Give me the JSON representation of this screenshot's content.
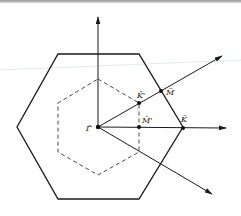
{
  "diagram": {
    "type": "hexagonal-brillouin-zone",
    "colors": {
      "stroke": "#1a1a1a",
      "dashed": "#333333",
      "faint_line": "#cfd8df"
    },
    "points": {
      "gamma": {
        "label": "Γ̄",
        "x": 98,
        "y": 127
      },
      "K": {
        "label": "K̄",
        "x": 183,
        "y": 128
      },
      "M": {
        "label": "M̄",
        "x": 161,
        "y": 91
      },
      "K_prime": {
        "label": "K̄'",
        "x": 139,
        "y": 103
      },
      "M_prime": {
        "label": "M̄'",
        "x": 139,
        "y": 127
      }
    },
    "outer_hexagon": "58,54 139,54 183,127 139,199 58,199 17,127",
    "inner_hexagon": "98,79 139,103 139,152 98,175 58,152 58,103",
    "axes": {
      "vertical": {
        "x1": 98,
        "y1": 127,
        "x2": 98,
        "y2": 17
      },
      "horizontal": {
        "x1": 98,
        "y1": 127,
        "x2": 226,
        "y2": 128
      },
      "upper_diagonal": {
        "x1": 98,
        "y1": 127,
        "x2": 222,
        "y2": 56
      },
      "lower_diagonal": {
        "x1": 98,
        "y1": 127,
        "x2": 212,
        "y2": 194
      }
    }
  }
}
